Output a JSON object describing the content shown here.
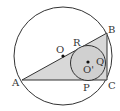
{
  "diagram": {
    "type": "geometry",
    "colors": {
      "stroke": "#333333",
      "triangle_fill": "#d8d8d8",
      "incircle_fill": "#d0d0d0",
      "background": "#ffffff"
    },
    "outer_circle": {
      "cx": 63,
      "cy": 56,
      "r": 49
    },
    "incircle": {
      "cx": 88,
      "cy": 63,
      "r": 18
    },
    "points": {
      "A": {
        "label": "A",
        "x": 22,
        "y": 80
      },
      "B": {
        "label": "B",
        "x": 107,
        "y": 33
      },
      "C": {
        "label": "C",
        "x": 107,
        "y": 80
      },
      "O": {
        "label": "O",
        "x": 63,
        "y": 56
      },
      "O_prime": {
        "label": "O'",
        "x": 88,
        "y": 63
      },
      "P": {
        "label": "P",
        "x": 88,
        "y": 80
      },
      "Q": {
        "label": "Q",
        "x": 106,
        "y": 63
      },
      "R": {
        "label": "R",
        "x": 80,
        "y": 47
      }
    },
    "labels": {
      "A": "A",
      "B": "B",
      "C": "C",
      "O": "O",
      "O_prime": "O'",
      "P": "P",
      "Q": "Q",
      "R": "R"
    }
  }
}
